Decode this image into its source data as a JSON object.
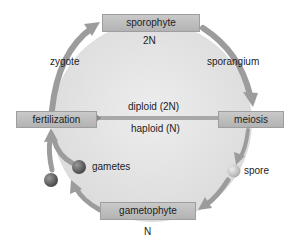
{
  "diagram": {
    "nodes": {
      "sporophyte": {
        "label": "sporophyte",
        "ploidy": "2N"
      },
      "meiosis": {
        "label": "meiosis"
      },
      "gametophyte": {
        "label": "gametophyte",
        "ploidy": "N"
      },
      "fertilization": {
        "label": "fertilization"
      }
    },
    "labels": {
      "zygote": "zygote",
      "sporangium": "sporangium",
      "spore": "spore",
      "gametes": "gametes",
      "diploid": "diploid (2N)",
      "haploid": "haploid (N)"
    },
    "edges": [
      {
        "from": "fertilization",
        "to": "sporophyte",
        "label": "zygote"
      },
      {
        "from": "sporophyte",
        "to": "meiosis",
        "label": "sporangium"
      },
      {
        "from": "meiosis",
        "to": "gametophyte",
        "label": "spore"
      },
      {
        "from": "gametophyte",
        "to": "fertilization",
        "label": "gametes"
      }
    ],
    "colors": {
      "disc": "#e6e6e6",
      "box": "#bdbdbd",
      "arrow": "#9a9a9a",
      "divider": "#a8a8a8",
      "gamete_ball": "#6e6e6e",
      "spore_ball": "#c8c8c8"
    }
  }
}
